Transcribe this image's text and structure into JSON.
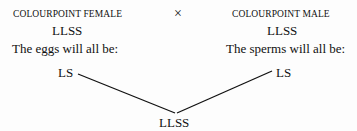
{
  "female": {
    "label": "COLOURPOINT FEMALE",
    "genotype": "LLSS",
    "gamete_text": "The eggs will all be:",
    "gamete": "LS"
  },
  "cross_symbol": "×",
  "male": {
    "label": "COLOURPOINT MALE",
    "genotype": "LLSS",
    "gamete_text": "The sperms will all be:",
    "gamete": "LS"
  },
  "offspring": {
    "genotype": "LLSS"
  }
}
